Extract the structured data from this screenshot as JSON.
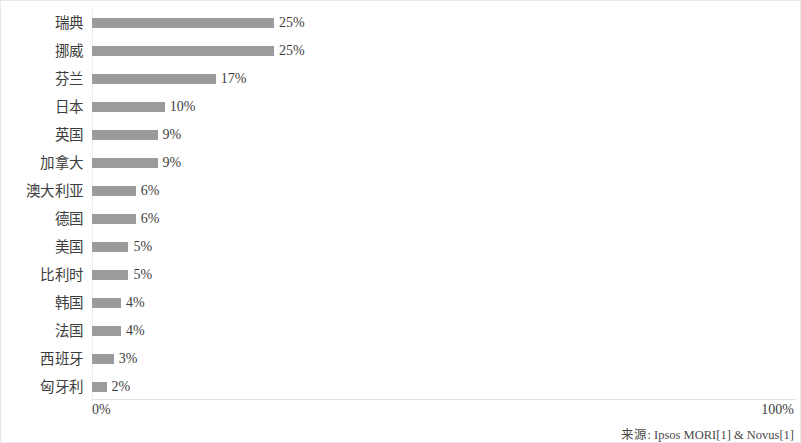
{
  "chart_data": {
    "type": "bar",
    "orientation": "horizontal",
    "title": "",
    "xlabel": "",
    "ylabel": "",
    "xlim": [
      0,
      100
    ],
    "grid": false,
    "legend": null,
    "value_suffix": "%",
    "categories": [
      "瑞典",
      "挪威",
      "芬兰",
      "日本",
      "英国",
      "加拿大",
      "澳大利亚",
      "德国",
      "美国",
      "比利时",
      "韩国",
      "法国",
      "西班牙",
      "匈牙利"
    ],
    "values": [
      25,
      25,
      17,
      10,
      9,
      9,
      6,
      6,
      5,
      5,
      4,
      4,
      3,
      2
    ],
    "value_labels": [
      "25%",
      "25%",
      "17%",
      "10%",
      "9%",
      "9%",
      "6%",
      "6%",
      "5%",
      "5%",
      "4%",
      "4%",
      "3%",
      "2%"
    ],
    "axis_tick_labels": [
      "0%",
      "100%"
    ],
    "bar_color": "#9b9b9b",
    "annotations": [
      "来源: Ipsos MORI[1] & Novus[1]"
    ]
  },
  "axis": {
    "min_label": "0%",
    "max_label": "100%"
  },
  "footer": {
    "source": "来源: Ipsos MORI[1] & Novus[1]"
  }
}
